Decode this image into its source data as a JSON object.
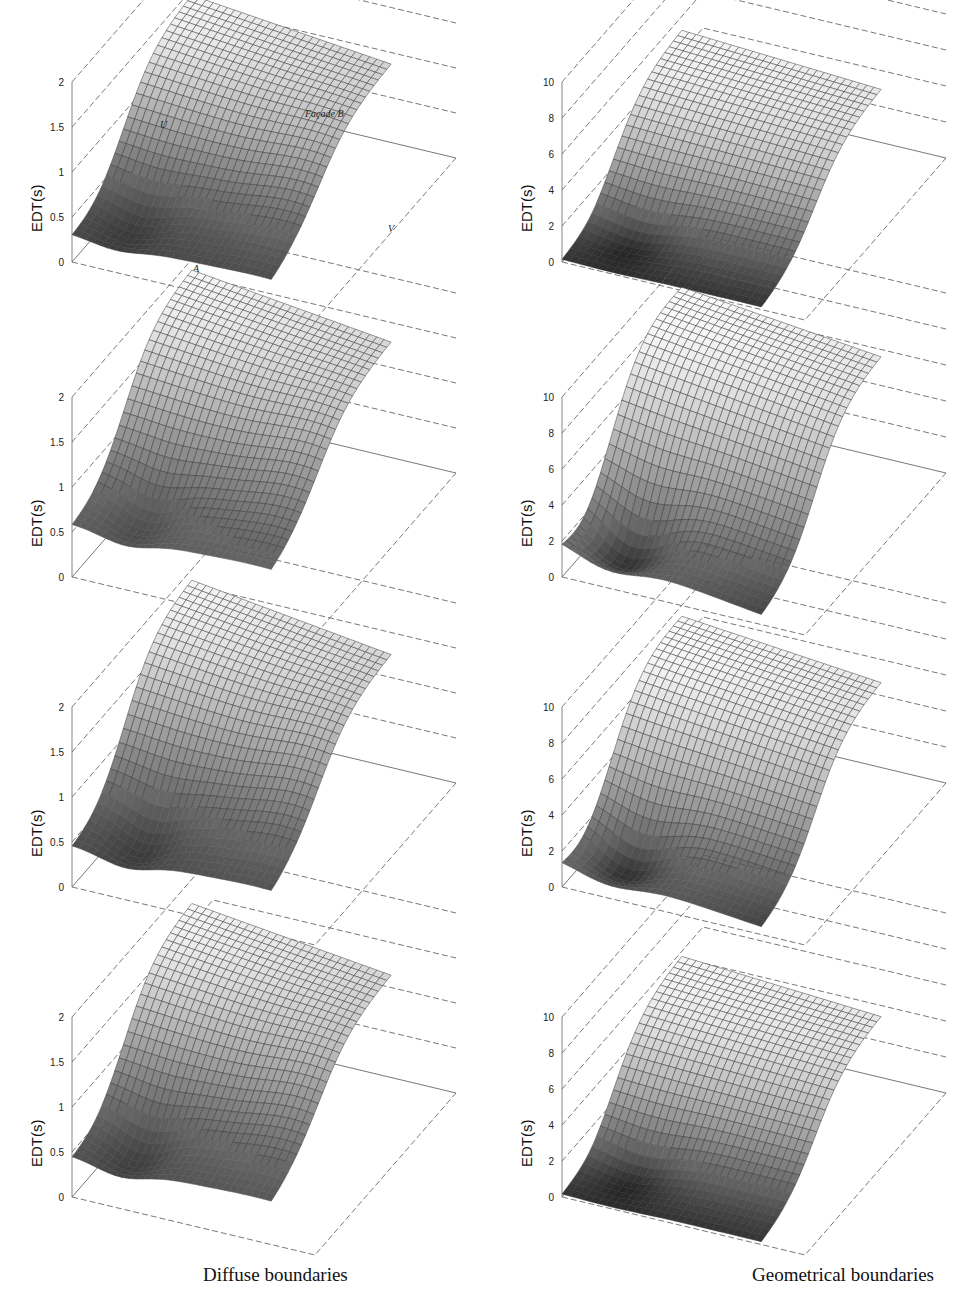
{
  "figure": {
    "columns": [
      {
        "caption": "Diffuse boundaries"
      },
      {
        "caption": "Geometrical boundaries"
      }
    ]
  },
  "annotations": {
    "top_left": {
      "facade": "Façade B",
      "u_label": "U",
      "v_label": "V",
      "a_label": "A"
    }
  },
  "chart_data": [
    {
      "type": "surface",
      "panel": "row1-left",
      "column": "Diffuse boundaries",
      "zlabel": "EDT(s)",
      "zlim": [
        0,
        2
      ],
      "zticks": [
        "0",
        "0.5",
        "1",
        "1.5",
        "2"
      ],
      "min_value": 0.25,
      "max_value": 1.5,
      "grid": true,
      "shape": {
        "base": 0.28,
        "peak": 1.45,
        "dip": 0.15,
        "dipcenter": 0.18
      },
      "annotations": [
        "Façade B",
        "U",
        "V",
        "A"
      ]
    },
    {
      "type": "surface",
      "panel": "row1-right",
      "column": "Geometrical boundaries",
      "zlabel": "EDT(s)",
      "zlim": [
        0,
        10
      ],
      "zticks": [
        "0",
        "2",
        "4",
        "6",
        "8",
        "10"
      ],
      "min_value": 0,
      "max_value": 5.5,
      "grid": true,
      "shape": {
        "base": 0.0,
        "peak": 5.3,
        "dip": 0.0,
        "dipcenter": 0.2
      }
    },
    {
      "type": "surface",
      "panel": "row2-left",
      "column": "Diffuse boundaries",
      "zlabel": "EDT(s)",
      "zlim": [
        0,
        2
      ],
      "zticks": [
        "0",
        "0.5",
        "1",
        "1.5",
        "2"
      ],
      "min_value": 0.35,
      "max_value": 1.95,
      "grid": true,
      "shape": {
        "base": 0.55,
        "peak": 1.9,
        "dip": 0.35,
        "dipcenter": 0.22
      }
    },
    {
      "type": "surface",
      "panel": "row2-right",
      "column": "Geometrical boundaries",
      "zlabel": "EDT(s)",
      "zlim": [
        0,
        10
      ],
      "zticks": [
        "0",
        "2",
        "4",
        "6",
        "8",
        "10"
      ],
      "min_value": 0,
      "max_value": 8.5,
      "grid": true,
      "shape": {
        "base": 1.8,
        "peak": 8.3,
        "dip": 0.0,
        "dipcenter": 0.2
      }
    },
    {
      "type": "surface",
      "panel": "row3-left",
      "column": "Diffuse boundaries",
      "zlabel": "EDT(s)",
      "zlim": [
        0,
        2
      ],
      "zticks": [
        "0",
        "0.5",
        "1",
        "1.5",
        "2"
      ],
      "min_value": 0.2,
      "max_value": 1.95,
      "grid": true,
      "shape": {
        "base": 0.42,
        "peak": 1.9,
        "dip": 0.2,
        "dipcenter": 0.22
      }
    },
    {
      "type": "surface",
      "panel": "row3-right",
      "column": "Geometrical boundaries",
      "zlabel": "EDT(s)",
      "zlim": [
        0,
        10
      ],
      "zticks": [
        "0",
        "2",
        "4",
        "6",
        "8",
        "10"
      ],
      "min_value": 0,
      "max_value": 7.5,
      "grid": true,
      "shape": {
        "base": 1.3,
        "peak": 7.3,
        "dip": 0.0,
        "dipcenter": 0.2
      }
    },
    {
      "type": "surface",
      "panel": "row4-left",
      "column": "Diffuse boundaries",
      "zlabel": "EDT(s)",
      "zlim": [
        0,
        2
      ],
      "zticks": [
        "0",
        "0.5",
        "1",
        "1.5",
        "2"
      ],
      "min_value": 0.2,
      "max_value": 1.8,
      "grid": true,
      "shape": {
        "base": 0.42,
        "peak": 1.75,
        "dip": 0.2,
        "dipcenter": 0.2
      }
    },
    {
      "type": "surface",
      "panel": "row4-right",
      "column": "Geometrical boundaries",
      "zlabel": "EDT(s)",
      "zlim": [
        0,
        10
      ],
      "zticks": [
        "0",
        "2",
        "4",
        "6",
        "8",
        "10"
      ],
      "min_value": 0,
      "max_value": 6.0,
      "grid": true,
      "shape": {
        "base": 0.0,
        "peak": 5.8,
        "dip": 0.0,
        "dipcenter": 0.2
      }
    }
  ]
}
